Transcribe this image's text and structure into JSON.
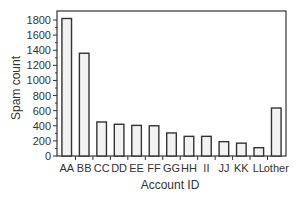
{
  "chart_data": {
    "type": "bar",
    "title": "",
    "xlabel": "Account ID",
    "ylabel": "Spam count",
    "categories": [
      "AA",
      "BB",
      "CC",
      "DD",
      "EE",
      "FF",
      "GG",
      "HH",
      "II",
      "JJ",
      "KK",
      "LL",
      "other"
    ],
    "values": [
      1820,
      1360,
      450,
      420,
      405,
      400,
      305,
      260,
      260,
      190,
      170,
      110,
      635
    ],
    "ylim": [
      0,
      1850
    ],
    "yticks": [
      0,
      200,
      400,
      600,
      800,
      1000,
      1200,
      1400,
      1600,
      1800
    ],
    "grid": false,
    "legend": null,
    "bar_fill": "#f2f2f2",
    "bar_stroke": "#333333"
  }
}
